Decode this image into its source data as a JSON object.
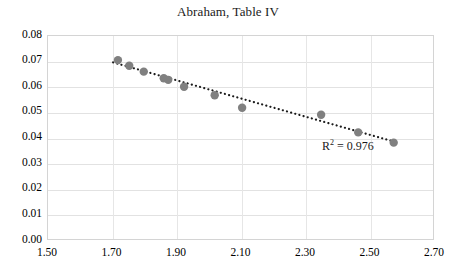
{
  "chart_data": {
    "type": "scatter",
    "title": "Abraham, Table IV",
    "xlabel": "",
    "ylabel": "",
    "xlim": [
      1.5,
      2.7
    ],
    "ylim": [
      0.0,
      0.08
    ],
    "xticks": [
      "1.50",
      "1.70",
      "1.90",
      "2.10",
      "2.30",
      "2.50",
      "2.70"
    ],
    "xtick_values": [
      1.5,
      1.7,
      1.9,
      2.1,
      2.3,
      2.5,
      2.7
    ],
    "yticks": [
      "0.00",
      "0.01",
      "0.02",
      "0.03",
      "0.04",
      "0.05",
      "0.06",
      "0.07",
      "0.08"
    ],
    "ytick_values": [
      0.0,
      0.01,
      0.02,
      0.03,
      0.04,
      0.05,
      0.06,
      0.07,
      0.08
    ],
    "grid": true,
    "legend": false,
    "marker_color": "#808080",
    "trendline_color": "#1a1a1a",
    "trendline_style": "dotted",
    "points": [
      {
        "x": 1.72,
        "y": 0.0702
      },
      {
        "x": 1.755,
        "y": 0.068
      },
      {
        "x": 1.8,
        "y": 0.0657
      },
      {
        "x": 1.862,
        "y": 0.0631
      },
      {
        "x": 1.876,
        "y": 0.0625
      },
      {
        "x": 1.925,
        "y": 0.0598
      },
      {
        "x": 2.02,
        "y": 0.0565
      },
      {
        "x": 2.105,
        "y": 0.0516
      },
      {
        "x": 2.35,
        "y": 0.0489
      },
      {
        "x": 2.465,
        "y": 0.042
      },
      {
        "x": 2.575,
        "y": 0.038
      }
    ],
    "trendline": {
      "x_start": 1.705,
      "y_start": 0.0693,
      "x_end": 2.59,
      "y_end": 0.0379
    },
    "annotations": [
      {
        "name": "r-squared",
        "text_prefix": "R",
        "text_sup": "2",
        "text_suffix": " = 0.976",
        "value": 0.976
      }
    ]
  }
}
